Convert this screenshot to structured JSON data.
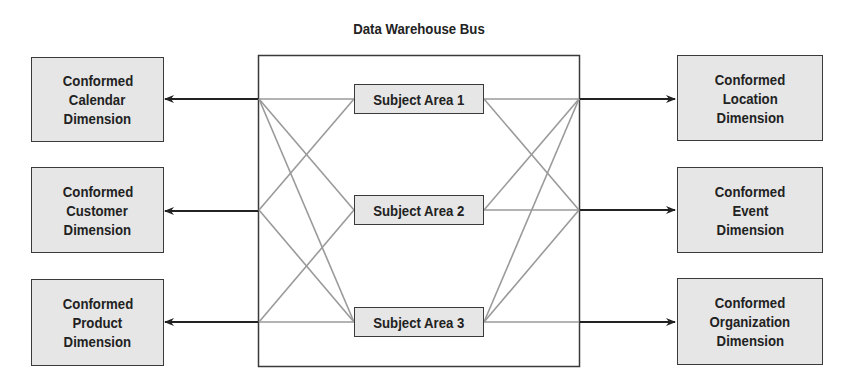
{
  "diagram": {
    "title": "Data Warehouse Bus",
    "subject_areas": [
      {
        "label": "Subject Area 1"
      },
      {
        "label": "Subject Area 2"
      },
      {
        "label": "Subject Area 3"
      }
    ],
    "left_dimensions": [
      {
        "line1": "Conformed",
        "line2": "Calendar",
        "line3": "Dimension"
      },
      {
        "line1": "Conformed",
        "line2": "Customer",
        "line3": "Dimension"
      },
      {
        "line1": "Conformed",
        "line2": "Product",
        "line3": "Dimension"
      }
    ],
    "right_dimensions": [
      {
        "line1": "Conformed",
        "line2": "Location",
        "line3": "Dimension"
      },
      {
        "line1": "Conformed",
        "line2": "Event",
        "line3": "Dimension"
      },
      {
        "line1": "Conformed",
        "line2": "Organization",
        "line3": "Dimension"
      }
    ],
    "colors": {
      "box_fill": "#e6e6e6",
      "box_border": "#3a3a3a",
      "connector": "#999999",
      "arrow": "#222222"
    }
  }
}
